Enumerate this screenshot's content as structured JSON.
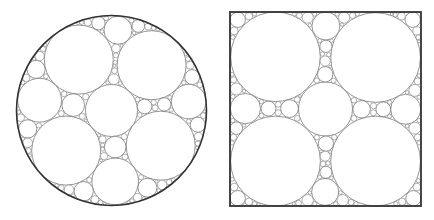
{
  "figure": {
    "panels": [
      {
        "name": "circle-packing-in-circle",
        "container": "circle",
        "center": [
          111.5,
          110.5
        ],
        "radius": 95,
        "central_circle_radius": 26,
        "min_radius": 1.4,
        "stroke": "#7a7a7a",
        "border_stroke": "#333333",
        "border_width": 1.6
      },
      {
        "name": "circle-packing-in-square",
        "container": "square",
        "x": 230,
        "y": 12,
        "width": 191,
        "height": 194,
        "central_circle_radius": 27,
        "min_radius": 1.4,
        "stroke": "#7a7a7a",
        "border_stroke": "#333333",
        "border_width": 1.8
      }
    ]
  }
}
